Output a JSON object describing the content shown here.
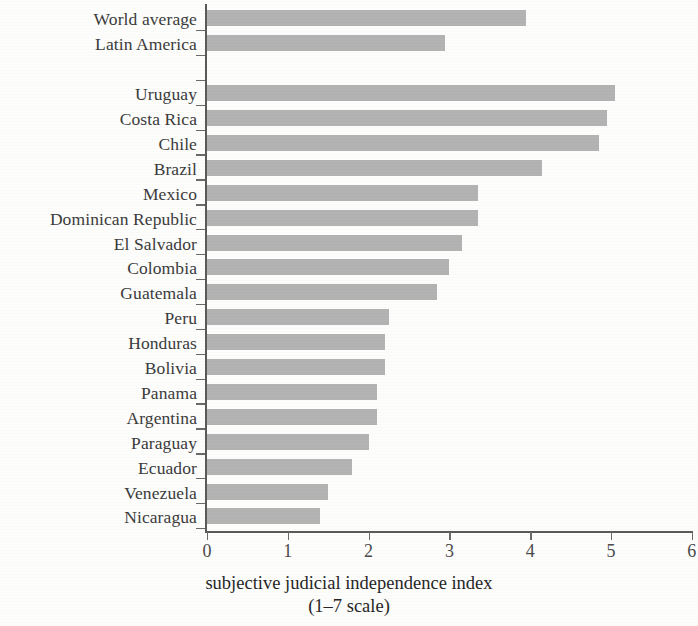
{
  "chart_data": {
    "type": "bar",
    "orientation": "horizontal",
    "title": "",
    "xlabel": "subjective judicial independence index (1–7 scale)",
    "xlabel_line1": "subjective judicial independence index",
    "xlabel_line2": "(1–7 scale)",
    "ylabel": "",
    "xlim": [
      0,
      6
    ],
    "xticks": [
      "0",
      "1",
      "2",
      "3",
      "4",
      "5",
      "6"
    ],
    "xtick_values": [
      0,
      1,
      2,
      3,
      4,
      5,
      6
    ],
    "grid": false,
    "legend": null,
    "bar_color": "#a9a9a9",
    "axis_color": "#5a5a5a",
    "categories": [
      "World average",
      "Latin America",
      "",
      "Uruguay",
      "Costa Rica",
      "Chile",
      "Brazil",
      "Mexico",
      "Dominican Republic",
      "El Salvador",
      "Colombia",
      "Guatemala",
      "Peru",
      "Honduras",
      "Bolivia",
      "Panama",
      "Argentina",
      "Paraguay",
      "Ecuador",
      "Venezuela",
      "Nicaragua"
    ],
    "values": [
      3.95,
      2.95,
      null,
      5.05,
      4.95,
      4.85,
      4.15,
      3.35,
      3.35,
      3.15,
      3.0,
      2.85,
      2.25,
      2.2,
      2.2,
      2.1,
      2.1,
      2.0,
      1.8,
      1.5,
      1.4
    ],
    "rows": [
      {
        "label": "World average",
        "value": 3.95,
        "group": "aggregate"
      },
      {
        "label": "Latin America",
        "value": 2.95,
        "group": "aggregate"
      },
      {
        "label": "",
        "value": null,
        "group": "spacer"
      },
      {
        "label": "Uruguay",
        "value": 5.05,
        "group": "country"
      },
      {
        "label": "Costa Rica",
        "value": 4.95,
        "group": "country"
      },
      {
        "label": "Chile",
        "value": 4.85,
        "group": "country"
      },
      {
        "label": "Brazil",
        "value": 4.15,
        "group": "country"
      },
      {
        "label": "Mexico",
        "value": 3.35,
        "group": "country"
      },
      {
        "label": "Dominican Republic",
        "value": 3.35,
        "group": "country"
      },
      {
        "label": "El Salvador",
        "value": 3.15,
        "group": "country"
      },
      {
        "label": "Colombia",
        "value": 3.0,
        "group": "country"
      },
      {
        "label": "Guatemala",
        "value": 2.85,
        "group": "country"
      },
      {
        "label": "Peru",
        "value": 2.25,
        "group": "country"
      },
      {
        "label": "Honduras",
        "value": 2.2,
        "group": "country"
      },
      {
        "label": "Bolivia",
        "value": 2.2,
        "group": "country"
      },
      {
        "label": "Panama",
        "value": 2.1,
        "group": "country"
      },
      {
        "label": "Argentina",
        "value": 2.1,
        "group": "country"
      },
      {
        "label": "Paraguay",
        "value": 2.0,
        "group": "country"
      },
      {
        "label": "Ecuador",
        "value": 1.8,
        "group": "country"
      },
      {
        "label": "Venezuela",
        "value": 1.5,
        "group": "country"
      },
      {
        "label": "Nicaragua",
        "value": 1.4,
        "group": "country"
      }
    ]
  }
}
